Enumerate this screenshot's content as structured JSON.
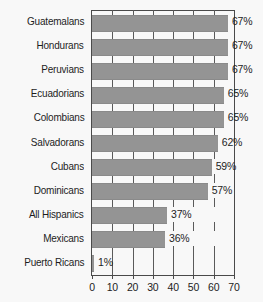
{
  "chart_data": {
    "type": "bar",
    "orientation": "horizontal",
    "title": "",
    "subtitle": "",
    "xlabel": "",
    "ylabel": "",
    "xlim": [
      0,
      70
    ],
    "xticks": [
      0,
      10,
      20,
      30,
      40,
      50,
      60,
      70
    ],
    "xtick_labels": [
      "0",
      "10",
      "20",
      "30",
      "40",
      "50",
      "60",
      "70"
    ],
    "grid": true,
    "grid_axis": "x",
    "legend": false,
    "legend_position": "none",
    "value_label_suffix": "%",
    "categories": [
      "Guatemalans",
      "Hondurans",
      "Peruvians",
      "Ecuadorians",
      "Colombians",
      "Salvadorans",
      "Cubans",
      "Dominicans",
      "All Hispanics",
      "Mexicans",
      "Puerto Ricans"
    ],
    "values": [
      67,
      67,
      67,
      65,
      65,
      62,
      59,
      57,
      37,
      36,
      1
    ],
    "value_labels": [
      "67%",
      "67%",
      "67%",
      "65%",
      "65%",
      "62%",
      "59%",
      "57%",
      "37%",
      "36%",
      "1%"
    ]
  },
  "style": {
    "bar_color": "#949494",
    "axis_color": "#4a4a4a",
    "text_color": "#1d1d1d",
    "background_color": "#f8f8f8"
  }
}
